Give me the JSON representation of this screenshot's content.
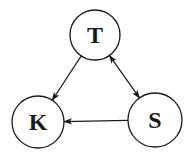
{
  "diagram": {
    "type": "directed-graph",
    "nodes": [
      {
        "id": "T",
        "label": "T"
      },
      {
        "id": "K",
        "label": "K"
      },
      {
        "id": "S",
        "label": "S"
      }
    ],
    "edges": [
      {
        "from": "T",
        "to": "K",
        "direction": "forward"
      },
      {
        "from": "T",
        "to": "S",
        "direction": "both"
      },
      {
        "from": "S",
        "to": "K",
        "direction": "forward"
      }
    ],
    "colors": {
      "stroke": "#1a1a1a",
      "background": "#ffffff"
    }
  }
}
